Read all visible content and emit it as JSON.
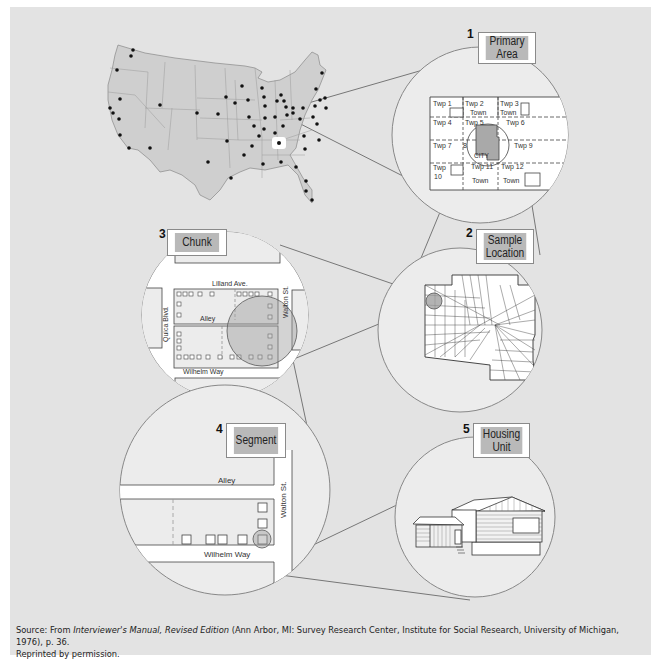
{
  "figure": {
    "steps": [
      {
        "number": "1",
        "label_line1": "Primary",
        "label_line2": "Area"
      },
      {
        "number": "2",
        "label_line1": "Sample",
        "label_line2": "Location"
      },
      {
        "number": "3",
        "label_line1": "Chunk",
        "label_line2": ""
      },
      {
        "number": "4",
        "label_line1": "Segment",
        "label_line2": ""
      },
      {
        "number": "5",
        "label_line1": "Housing",
        "label_line2": "Unit"
      }
    ],
    "primary_area_map": {
      "townships": [
        "Twp 1",
        "Twp 2",
        "Town",
        "Twp 3",
        "Town",
        "Twp 4",
        "Twp 5",
        "Twp 6",
        "Twp 7",
        "8",
        "CITY",
        "Twp 9",
        "Twp",
        "10",
        "Twp 11",
        "Town",
        "Twp 12",
        "Town"
      ]
    },
    "chunk_map": {
      "streets": [
        "Lilland Ave.",
        "Alley",
        "Quica Blvd.",
        "Walton St.",
        "Wilhelm Way"
      ]
    },
    "segment_map": {
      "streets": [
        "Alley",
        "Walton St.",
        "Wilhelm Way"
      ]
    },
    "colors": {
      "panel_bg": "#e3e3e3",
      "circle_fill": "#ececec",
      "label_fill": "#b9b9b9",
      "map_fill": "#cfcfcf",
      "line": "#777777"
    }
  },
  "source": {
    "prefix": "Source: From ",
    "title_italic": "Interviewer's Manual, Revised Edition",
    "rest": " (Ann Arbor, MI: Survey Research Center, Institute for Social Research, University of Michigan, 1976), p. 36.",
    "line2": "Reprinted by permission."
  }
}
